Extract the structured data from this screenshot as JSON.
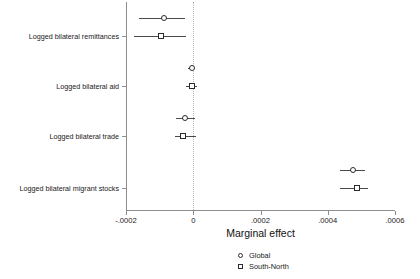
{
  "chart_data": {
    "type": "scatter",
    "subtype": "coefficient-plot",
    "title": "",
    "xlabel": "Marginal effect",
    "ylabel": "",
    "xlim": [
      -0.0003,
      0.0006
    ],
    "ylim": [
      0,
      4
    ],
    "grid": false,
    "zero_reference_line": 0,
    "xtick_labels": [
      "-.0002",
      "0",
      ".0002",
      ".0004",
      ".0006"
    ],
    "xtick_values": [
      -0.0002,
      0,
      0.0002,
      0.0004,
      0.0006
    ],
    "categories": [
      "Logged bilateral remittances",
      "Logged bilateral aid",
      "Logged bilateral trade",
      "Logged bilateral migrant stocks"
    ],
    "legend_position": "bottom-center",
    "series": [
      {
        "name": "Global",
        "marker": "circle",
        "values": [
          -8.6e-05,
          -5e-06,
          -2.45e-05,
          0.000476
        ],
        "ci_low": [
          -0.00016,
          -1.65e-05,
          -5e-05,
          0.000435
        ],
        "ci_high": [
          -2.4e-05,
          6.6e-06,
          4.1e-06,
          0.00051
        ]
      },
      {
        "name": "South-North",
        "marker": "square",
        "values": [
          -9.6e-05,
          -4e-06,
          -3e-05,
          0.000486
        ],
        "ci_low": [
          -0.000176,
          -2.05e-05,
          -5.5e-05,
          0.000435
        ],
        "ci_high": [
          -2.1e-05,
          1.23e-05,
          8.2e-06,
          0.00052
        ]
      }
    ]
  },
  "legend": {
    "items": [
      {
        "label": "Global",
        "marker": "circle"
      },
      {
        "label": "South-North",
        "marker": "square"
      }
    ]
  },
  "axis": {
    "x_title": "Marginal effect"
  },
  "colors": {
    "marker_edge": "#2b2b2b",
    "whisker": "#4a4a4a",
    "axis": "#8d8d8d",
    "zero_line": "#b4b4b4",
    "text": "#1a1a1a",
    "background": "#ffffff"
  }
}
